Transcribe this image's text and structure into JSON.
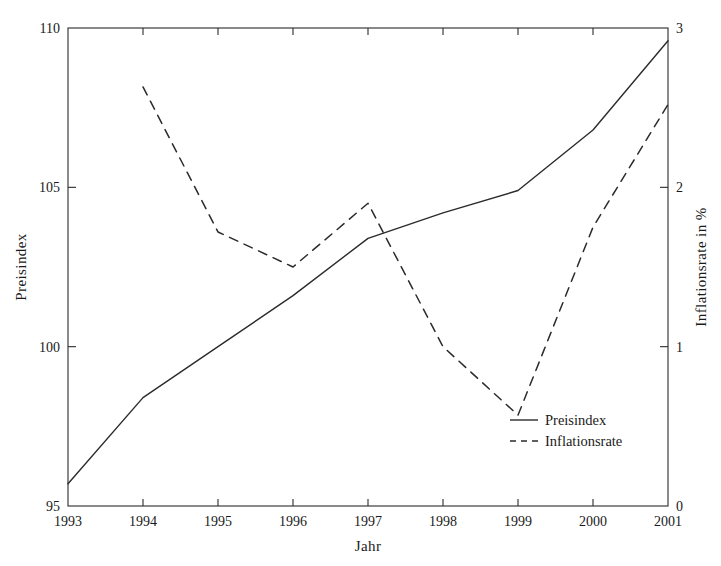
{
  "chart_data": {
    "type": "line",
    "title": "",
    "xlabel": "Jahr",
    "ylabel": "Preisindex",
    "y2label": "Inflationsrate in %",
    "grid": false,
    "legend_position": "inside bottom-right",
    "x": [
      1993,
      1994,
      1995,
      1996,
      1997,
      1998,
      1999,
      2000,
      2001
    ],
    "x_tick_labels": [
      "1993",
      "1994",
      "1995",
      "1996",
      "1997",
      "1998",
      "1999",
      "2000",
      "2001"
    ],
    "xlim": [
      1993,
      2001
    ],
    "ylim": [
      95,
      110
    ],
    "y_tick_labels": [
      "95",
      "100",
      "105",
      "110"
    ],
    "y_ticks": [
      95,
      100,
      105,
      110
    ],
    "y2lim": [
      0,
      3
    ],
    "y2_tick_labels": [
      "0",
      "1",
      "2",
      "3"
    ],
    "y2_ticks": [
      0,
      1,
      2,
      3
    ],
    "series": [
      {
        "name": "Preisindex",
        "axis": "left",
        "style": "solid",
        "x": [
          1993,
          1994,
          1995,
          1996,
          1997,
          1998,
          1999,
          2000,
          2001
        ],
        "values": [
          95.7,
          98.4,
          100.0,
          101.6,
          103.4,
          104.2,
          104.9,
          106.8,
          109.6
        ]
      },
      {
        "name": "Inflationsrate",
        "axis": "right",
        "style": "dashed",
        "x": [
          1994,
          1995,
          1996,
          1997,
          1998,
          1999,
          2000,
          2001
        ],
        "values": [
          2.63,
          1.72,
          1.5,
          1.9,
          1.0,
          0.57,
          1.75,
          2.52
        ]
      }
    ]
  },
  "legend": {
    "items": [
      {
        "label": "Preisindex",
        "style": "solid"
      },
      {
        "label": "Inflationsrate",
        "style": "dashed"
      }
    ]
  }
}
